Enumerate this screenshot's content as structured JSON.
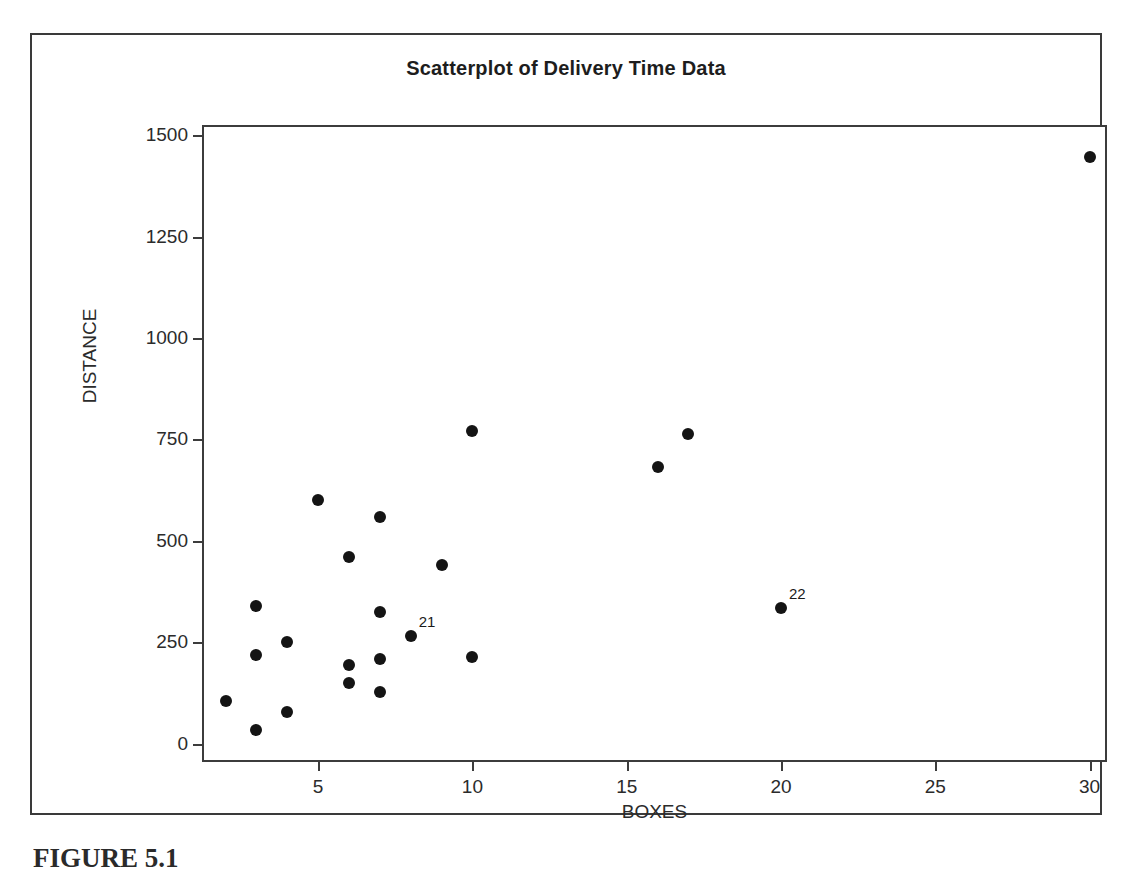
{
  "chart_data": {
    "type": "scatter",
    "title": "Scatterplot of Delivery Time Data",
    "xlabel": "BOXES",
    "ylabel": "DISTANCE",
    "xlim": [
      1.3,
      30.5
    ],
    "ylim": [
      -40,
      1520
    ],
    "xticks": [
      5,
      10,
      15,
      20,
      25,
      30
    ],
    "yticks": [
      0,
      250,
      500,
      750,
      1000,
      1250,
      1500
    ],
    "grid": false,
    "legend": null,
    "marker": "filled-circle",
    "marker_color": "#141414",
    "points": [
      {
        "x": 2,
        "y": 105,
        "label": null
      },
      {
        "x": 3,
        "y": 340,
        "label": null
      },
      {
        "x": 3,
        "y": 218,
        "label": null
      },
      {
        "x": 3,
        "y": 35,
        "label": null
      },
      {
        "x": 4,
        "y": 252,
        "label": null
      },
      {
        "x": 4,
        "y": 78,
        "label": null
      },
      {
        "x": 5,
        "y": 600,
        "label": null
      },
      {
        "x": 6,
        "y": 460,
        "label": null
      },
      {
        "x": 6,
        "y": 193,
        "label": null
      },
      {
        "x": 6,
        "y": 150,
        "label": null
      },
      {
        "x": 7,
        "y": 560,
        "label": null
      },
      {
        "x": 7,
        "y": 325,
        "label": null
      },
      {
        "x": 7,
        "y": 210,
        "label": null
      },
      {
        "x": 7,
        "y": 128,
        "label": null
      },
      {
        "x": 8,
        "y": 265,
        "label": "21"
      },
      {
        "x": 9,
        "y": 440,
        "label": null
      },
      {
        "x": 10,
        "y": 770,
        "label": null
      },
      {
        "x": 10,
        "y": 213,
        "label": null
      },
      {
        "x": 16,
        "y": 683,
        "label": null
      },
      {
        "x": 17,
        "y": 763,
        "label": null
      },
      {
        "x": 20,
        "y": 335,
        "label": "22"
      },
      {
        "x": 30,
        "y": 1447,
        "label": null
      }
    ]
  },
  "page": {
    "caption": "FIGURE 5.1"
  }
}
